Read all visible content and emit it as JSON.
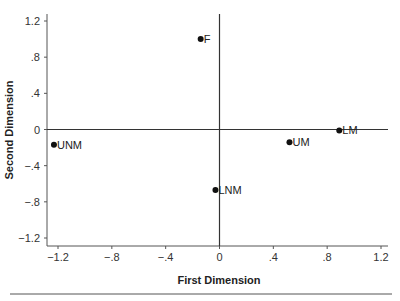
{
  "chart_data": {
    "type": "scatter",
    "title": "",
    "xlabel": "First Dimension",
    "ylabel": "Second Dimension",
    "xlim": [
      -1.3,
      1.25
    ],
    "ylim": [
      -1.3,
      1.28
    ],
    "x_ticks": [
      -1.2,
      -0.8,
      -0.4,
      0,
      0.4,
      0.8,
      1.2
    ],
    "x_tick_labels": [
      "−1.2",
      "−.8",
      "−.4",
      "0",
      ".4",
      ".8",
      "1.2"
    ],
    "y_ticks": [
      1.2,
      0.8,
      0.4,
      0,
      -0.4,
      -0.8,
      -1.2
    ],
    "y_tick_labels": [
      "1.2",
      ".8",
      ".4",
      "0",
      "−.4",
      "−.8",
      "−1.2"
    ],
    "grid": false,
    "reference_lines": {
      "x": 0,
      "y": 0
    },
    "legend": null,
    "points": [
      {
        "label": "F",
        "x": -0.14,
        "y": 1.0
      },
      {
        "label": "UNM",
        "x": -1.23,
        "y": -0.17
      },
      {
        "label": "UM",
        "x": 0.52,
        "y": -0.14
      },
      {
        "label": "LM",
        "x": 0.89,
        "y": -0.01
      },
      {
        "label": "LNM",
        "x": -0.03,
        "y": -0.67
      }
    ]
  }
}
